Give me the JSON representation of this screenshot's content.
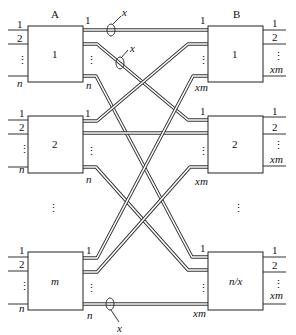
{
  "diagram": {
    "title_left": "A",
    "title_right": "B",
    "left_boxes": [
      {
        "label": "1",
        "inputs": [
          "1",
          "2",
          "⋮",
          "n"
        ],
        "outputs": [
          "1",
          "⋮",
          "n"
        ]
      },
      {
        "label": "2",
        "inputs": [
          "1",
          "2",
          "⋮",
          "n"
        ],
        "outputs": [
          "1",
          "⋮",
          "n"
        ]
      },
      {
        "label": "m",
        "inputs": [
          "1",
          "2",
          "⋮",
          "n"
        ],
        "outputs": [
          "1",
          "⋮",
          "n"
        ]
      }
    ],
    "right_boxes": [
      {
        "label": "1",
        "inputs": [
          "1",
          "⋮",
          "xm"
        ],
        "outputs": [
          "1",
          "2",
          "⋮",
          "xm"
        ]
      },
      {
        "label": "2",
        "inputs": [
          "1",
          "⋮",
          "xm"
        ],
        "outputs": [
          "1",
          "2",
          "⋮",
          "xm"
        ]
      },
      {
        "label": "n/x",
        "inputs": [
          "1",
          "⋮",
          "xm"
        ],
        "outputs": [
          "1",
          "2",
          "⋮",
          "xm"
        ]
      }
    ],
    "ellipsis_left": "⋮",
    "ellipsis_right": "⋮",
    "bundle_labels": [
      "x",
      "x",
      "x"
    ]
  }
}
